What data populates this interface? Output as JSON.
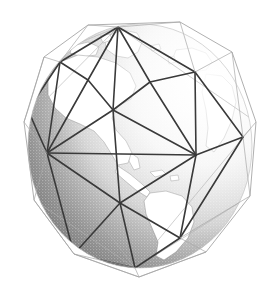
{
  "figure": {
    "title": "Geodesic polyhedron circumscribed about the Earth",
    "caption": "",
    "background_color": "#ffffff",
    "width": 280,
    "height": 291
  },
  "globe": {
    "center_x": 140,
    "center_y": 146,
    "radius_x": 112,
    "radius_y": 122,
    "ocean_shade_dark": "#595959",
    "ocean_shade_light": "#d8d8d8",
    "land_color": "#ffffff",
    "coastline_color": "#8a8a8a",
    "terminator_note": "light source from upper right; left limb in shadow",
    "view": "Western Hemisphere, Atlantic and Americas facing viewer",
    "continents": [
      "North America",
      "South America",
      "Greenland",
      "Africa",
      "Europe"
    ]
  },
  "wireframe": {
    "type": "geodesic-polyhedron",
    "front_edge_color": "#3a3a3a",
    "back_edge_color": "#b0b0b0",
    "hull_edge_color": "#9a9a9a",
    "front_edge_width": 1.6,
    "back_edge_width": 0.7,
    "hull_edge_width": 0.8,
    "vertices": [
      {
        "name": "north-pole-hub",
        "x": 118,
        "y": 27
      },
      {
        "name": "upper-left-vertex",
        "x": 60,
        "y": 62
      },
      {
        "name": "upper-mid-vertex",
        "x": 113,
        "y": 110
      },
      {
        "name": "upper-right-vertex",
        "x": 195,
        "y": 72
      },
      {
        "name": "equator-left-hub",
        "x": 47,
        "y": 153
      },
      {
        "name": "equator-right-hub",
        "x": 196,
        "y": 155
      },
      {
        "name": "lower-mid-vertex",
        "x": 120,
        "y": 203
      },
      {
        "name": "south-pole-hub",
        "x": 135,
        "y": 268
      },
      {
        "name": "right-limb-vertex",
        "x": 243,
        "y": 137
      },
      {
        "name": "left-limb-vertex",
        "x": 28,
        "y": 110
      }
    ],
    "hull_outline": [
      {
        "x": 88,
        "y": 25
      },
      {
        "x": 180,
        "y": 22
      },
      {
        "x": 232,
        "y": 52
      },
      {
        "x": 256,
        "y": 122
      },
      {
        "x": 250,
        "y": 196
      },
      {
        "x": 206,
        "y": 252
      },
      {
        "x": 139,
        "y": 277
      },
      {
        "x": 74,
        "y": 254
      },
      {
        "x": 34,
        "y": 200
      },
      {
        "x": 24,
        "y": 122
      },
      {
        "x": 44,
        "y": 57
      }
    ],
    "visible_edge_count": 52,
    "face_count": 36
  },
  "labels": {
    "figure_label": "",
    "axis_label": "",
    "annotation": ""
  }
}
